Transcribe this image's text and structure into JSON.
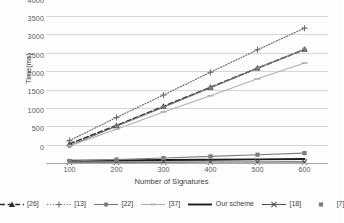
{
  "chart_data": {
    "type": "line",
    "title": "",
    "xlabel": "Number of Signatures",
    "ylabel": "Time(ms)",
    "categories": [
      100,
      200,
      300,
      400,
      500,
      600
    ],
    "xticklabels": [
      "100",
      "200",
      "300",
      "400",
      "500",
      "600"
    ],
    "yticklabels": [
      "0",
      "500",
      "1000",
      "1500",
      "2000",
      "2500",
      "3000",
      "3500",
      "4000"
    ],
    "yticks": [
      0,
      500,
      1000,
      1500,
      2000,
      2500,
      3000,
      3500,
      4000
    ],
    "ylim": [
      0,
      4000
    ],
    "grid": "horizontal",
    "legend_position": "bottom",
    "series": [
      {
        "name": "[26]",
        "values": [
          520,
          1020,
          1540,
          2060,
          2580,
          3090
        ],
        "color": "#2d2d2d",
        "style": "dashed",
        "marker": "triangle"
      },
      {
        "name": "[13]",
        "values": [
          610,
          1240,
          1850,
          2470,
          3080,
          3670
        ],
        "color": "#6b6b6b",
        "style": "dotted",
        "marker": "plus"
      },
      {
        "name": "[22]",
        "values": [
          470,
          1000,
          1520,
          2050,
          2580,
          3090
        ],
        "color": "#7a7a7a",
        "style": "solid",
        "marker": "circle"
      },
      {
        "name": "[37]",
        "values": [
          460,
          920,
          1390,
          1830,
          2290,
          2720
        ],
        "color": "#b0b0b0",
        "style": "solid",
        "marker": "dash"
      },
      {
        "name": "Our scheme",
        "values": [
          60,
          70,
          80,
          90,
          100,
          110
        ],
        "color": "#1a1a1a",
        "style": "solid-bold",
        "marker": "none"
      },
      {
        "name": "[18]",
        "values": [
          20,
          22,
          24,
          26,
          28,
          30
        ],
        "color": "#555555",
        "style": "solid",
        "marker": "x"
      },
      {
        "name": "[7]",
        "values": [
          55,
          95,
          135,
          180,
          225,
          270
        ],
        "color": "#7d7d7d",
        "style": "solid",
        "marker": "square"
      }
    ]
  },
  "legend": {
    "items": [
      {
        "label": "[26]"
      },
      {
        "label": "[13]"
      },
      {
        "label": "[22]"
      },
      {
        "label": "[37]"
      },
      {
        "label": "Our scheme"
      },
      {
        "label": "[18]"
      },
      {
        "label": "[7]"
      }
    ]
  },
  "colors": {
    "grid": "#d6d6d6",
    "axis": "#a8a8a8",
    "text": "#3f3f3f",
    "background": "#fdfdfd"
  }
}
